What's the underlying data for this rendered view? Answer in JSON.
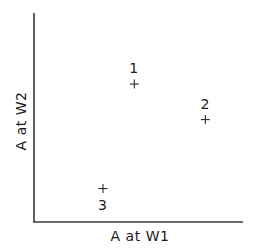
{
  "chart_data": {
    "type": "scatter",
    "title": "",
    "xlabel": "A at W1",
    "ylabel": "A at W2",
    "xlim": [
      0,
      1
    ],
    "ylim": [
      0,
      1
    ],
    "grid": false,
    "ticks": "none",
    "legend": null,
    "marker": "+",
    "points": [
      {
        "label": "1",
        "x": 0.48,
        "y": 0.66,
        "label_position": "above"
      },
      {
        "label": "2",
        "x": 0.82,
        "y": 0.49,
        "label_position": "above"
      },
      {
        "label": "3",
        "x": 0.33,
        "y": 0.16,
        "label_position": "below"
      }
    ]
  },
  "axes": {
    "x_title": "A at W1",
    "y_title": "A at W2"
  }
}
